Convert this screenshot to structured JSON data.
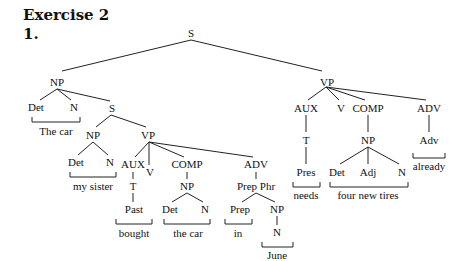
{
  "heading": {
    "title": "Exercise 2",
    "item_number": "1."
  },
  "tree": {
    "root": "S",
    "nodes": [
      {
        "id": "s_root",
        "label": "S",
        "x": 191,
        "y": 37
      },
      {
        "id": "np_subj",
        "label": "NP",
        "x": 57,
        "y": 83
      },
      {
        "id": "det1",
        "label": "Det",
        "x": 36,
        "y": 111
      },
      {
        "id": "n1",
        "label": "N",
        "x": 74,
        "y": 111
      },
      {
        "id": "s_rel",
        "label": "S",
        "x": 112,
        "y": 112
      },
      {
        "id": "np_rel",
        "label": "NP",
        "x": 93,
        "y": 138
      },
      {
        "id": "det2",
        "label": "Det",
        "x": 76,
        "y": 166
      },
      {
        "id": "n2",
        "label": "N",
        "x": 110,
        "y": 166
      },
      {
        "id": "vp_rel",
        "label": "VP",
        "x": 148,
        "y": 138
      },
      {
        "id": "aux_rel",
        "label": "AUX",
        "x": 133,
        "y": 168
      },
      {
        "id": "v_rel",
        "label": "V",
        "x": 150,
        "y": 176
      },
      {
        "id": "comp_rel",
        "label": "COMP",
        "x": 187,
        "y": 168
      },
      {
        "id": "adv_rel",
        "label": "ADV",
        "x": 256,
        "y": 168
      },
      {
        "id": "t_rel",
        "label": "T",
        "x": 133,
        "y": 189
      },
      {
        "id": "past",
        "label": "Past",
        "x": 134,
        "y": 213
      },
      {
        "id": "np_obj_rel",
        "label": "NP",
        "x": 187,
        "y": 189
      },
      {
        "id": "det3",
        "label": "Det",
        "x": 170,
        "y": 213
      },
      {
        "id": "n3",
        "label": "N",
        "x": 205,
        "y": 213
      },
      {
        "id": "prepphr",
        "label": "Prep Phr",
        "x": 256,
        "y": 189
      },
      {
        "id": "prep",
        "label": "Prep",
        "x": 240,
        "y": 213
      },
      {
        "id": "np_pp",
        "label": "NP",
        "x": 277,
        "y": 213
      },
      {
        "id": "n_june",
        "label": "N",
        "x": 277,
        "y": 236
      },
      {
        "id": "vp_main",
        "label": "VP",
        "x": 327,
        "y": 83
      },
      {
        "id": "aux_main",
        "label": "AUX",
        "x": 306,
        "y": 111
      },
      {
        "id": "v_main",
        "label": "V",
        "x": 341,
        "y": 111
      },
      {
        "id": "comp_main",
        "label": "COMP",
        "x": 368,
        "y": 111
      },
      {
        "id": "adv_main",
        "label": "ADV",
        "x": 429,
        "y": 111
      },
      {
        "id": "t_main",
        "label": "T",
        "x": 306,
        "y": 143
      },
      {
        "id": "pres",
        "label": "Pres",
        "x": 306,
        "y": 175
      },
      {
        "id": "np_obj_main",
        "label": "NP",
        "x": 368,
        "y": 143
      },
      {
        "id": "det4",
        "label": "Det",
        "x": 337,
        "y": 175
      },
      {
        "id": "adj4",
        "label": "Adj",
        "x": 368,
        "y": 175
      },
      {
        "id": "n4",
        "label": "N",
        "x": 402,
        "y": 175
      },
      {
        "id": "adv_word",
        "label": "Adv",
        "x": 429,
        "y": 143
      }
    ],
    "words": [
      {
        "id": "w_the_car",
        "text": "The car",
        "x": 56,
        "y": 134,
        "bracket": [
          32,
          80,
          122
        ]
      },
      {
        "id": "w_my_sister",
        "text": "my sister",
        "x": 93,
        "y": 189,
        "bracket": [
          70,
          116,
          177
        ]
      },
      {
        "id": "w_bought",
        "text": "bought",
        "x": 134,
        "y": 236,
        "bracket": [
          116,
          152,
          224
        ]
      },
      {
        "id": "w_the_car2",
        "text": "the car",
        "x": 188,
        "y": 236,
        "bracket": [
          164,
          210,
          224
        ]
      },
      {
        "id": "w_in",
        "text": "in",
        "x": 238,
        "y": 236,
        "bracket": [
          225,
          252,
          224
        ]
      },
      {
        "id": "w_june",
        "text": "June",
        "x": 277,
        "y": 259,
        "bracket": [
          262,
          293,
          247
        ]
      },
      {
        "id": "w_needs",
        "text": "needs",
        "x": 306,
        "y": 198,
        "bracket": [
          293,
          320,
          187
        ]
      },
      {
        "id": "w_four_new_tires",
        "text": "four new tires",
        "x": 368,
        "y": 198,
        "bracket": [
          330,
          408,
          187
        ]
      },
      {
        "id": "w_already",
        "text": "already",
        "x": 429,
        "y": 169,
        "bracket": [
          413,
          445,
          158
        ]
      }
    ]
  }
}
